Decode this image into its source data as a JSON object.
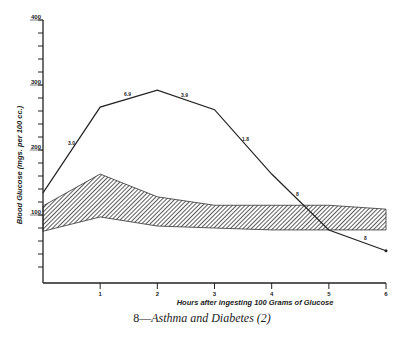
{
  "chart_data": {
    "type": "line",
    "title": "",
    "caption": "8—Asthma and Diabetes (2)",
    "caption_number": "8—",
    "caption_text": "Asthma and Diabetes (2)",
    "xlabel": "Hours after ingesting 100 Grams of Glucose",
    "ylabel": "Blood Glucose (mgs. per 100 cc.)",
    "x": [
      0,
      1,
      2,
      3,
      4,
      5,
      6
    ],
    "x_tick_labels": [
      "1",
      "2",
      "3",
      "4",
      "5",
      "6"
    ],
    "y_tick_labels": [
      "100",
      "200",
      "300",
      "400"
    ],
    "ylim": [
      0,
      400
    ],
    "xlim": [
      0,
      6
    ],
    "grid": false,
    "series": [
      {
        "name": "Patient blood glucose",
        "values": [
          134,
          266,
          292,
          262,
          163,
          77,
          45
        ]
      },
      {
        "name": "Normal range (upper)",
        "values": [
          114,
          163,
          128,
          115,
          115,
          115,
          109
        ]
      },
      {
        "name": "Normal range (lower)",
        "values": [
          75,
          97,
          83,
          80,
          77,
          77,
          77
        ]
      }
    ],
    "segment_annotations": [
      "3.0",
      "6.9",
      "3.9",
      "1.8",
      "8",
      "8"
    ],
    "shaded_band": "hatched normal range between upper and lower series"
  }
}
